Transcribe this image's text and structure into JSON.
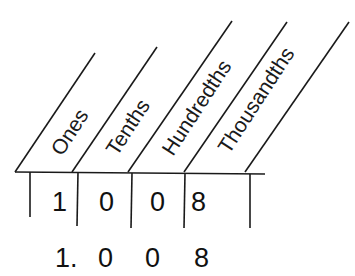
{
  "diagram": {
    "type": "place-value chart",
    "columns": [
      {
        "label": "Ones",
        "digit": "1"
      },
      {
        "label": "Tenths",
        "digit": "0"
      },
      {
        "label": "Hundredths",
        "digit": "0"
      },
      {
        "label": "Thousandths",
        "digit": "8"
      }
    ],
    "decimal_number": {
      "whole": "1.",
      "d1": "0",
      "d2": "0",
      "d3": "8"
    },
    "colors": {
      "ink": "#1a1a1a",
      "background": "#ffffff"
    }
  }
}
